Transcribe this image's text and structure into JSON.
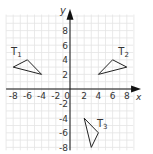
{
  "chart_data": {
    "type": "scatter",
    "title": "",
    "xlabel": "x",
    "ylabel": "y",
    "xlim": [
      -9,
      9
    ],
    "ylim": [
      -8.5,
      10
    ],
    "grid": true,
    "x_ticks": [
      -8,
      -6,
      -4,
      -2,
      0,
      2,
      4,
      6,
      8
    ],
    "y_ticks": [
      -8,
      -6,
      -4,
      -2,
      2,
      4,
      6,
      8
    ],
    "x_tick_labels": [
      "-8",
      "-6",
      "-4",
      "-2",
      "0",
      "2",
      "4",
      "6",
      "8"
    ],
    "y_tick_labels": [
      "-8",
      "-6",
      "-4",
      "-2",
      "2",
      "4",
      "6",
      "8"
    ],
    "shapes": [
      {
        "name": "T1",
        "label_main": "T",
        "label_sub": "1",
        "vertices": [
          [
            -8,
            3
          ],
          [
            -6,
            4
          ],
          [
            -4,
            2
          ]
        ],
        "label_pos": [
          -8.3,
          4.6
        ]
      },
      {
        "name": "T2",
        "label_main": "T",
        "label_sub": "2",
        "vertices": [
          [
            4,
            2
          ],
          [
            6,
            4
          ],
          [
            8,
            3
          ]
        ],
        "label_pos": [
          6.8,
          4.6
        ]
      },
      {
        "name": "T3",
        "label_main": "T",
        "label_sub": "3",
        "vertices": [
          [
            2,
            -4
          ],
          [
            4,
            -6
          ],
          [
            3,
            -8
          ]
        ],
        "label_pos": [
          3.8,
          -5.2
        ]
      }
    ]
  },
  "axes": {
    "x_label": "x",
    "y_label": "y",
    "origin_label": "0"
  },
  "colors": {
    "grid": "#e4e4e4",
    "axis": "#111111",
    "shape_stroke": "#222222",
    "text": "#333333"
  }
}
